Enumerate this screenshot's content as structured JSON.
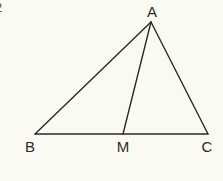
{
  "figure": {
    "corner_mark": "2",
    "colors": {
      "background": "#faf9f2",
      "stroke": "#2a2a2a"
    },
    "points": {
      "A": {
        "label": "A",
        "x": 151,
        "y": 22,
        "lx": 152,
        "ly": 17
      },
      "B": {
        "label": "B",
        "x": 35,
        "y": 134,
        "lx": 30,
        "ly": 152
      },
      "M": {
        "label": "M",
        "x": 123,
        "y": 134,
        "lx": 123,
        "ly": 152
      },
      "C": {
        "label": "C",
        "x": 208,
        "y": 134,
        "lx": 207,
        "ly": 152
      }
    },
    "segments": [
      {
        "name": "segment-AB",
        "from": "A",
        "to": "B"
      },
      {
        "name": "segment-AC",
        "from": "A",
        "to": "C"
      },
      {
        "name": "segment-BC",
        "from": "B",
        "to": "C"
      },
      {
        "name": "segment-AM",
        "from": "A",
        "to": "M"
      }
    ]
  }
}
